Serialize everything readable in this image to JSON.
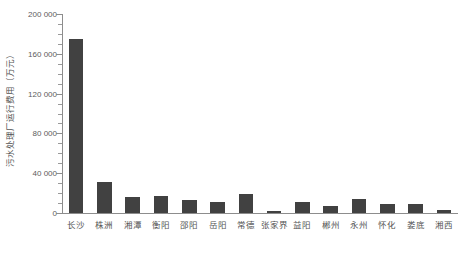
{
  "chart_data": {
    "type": "bar",
    "title": "",
    "subtitle": "",
    "xlabel": "",
    "ylabel": "污水处理厂运行费用（万元）",
    "categories": [
      "长沙",
      "株洲",
      "湘潭",
      "衡阳",
      "邵阳",
      "岳阳",
      "常德",
      "张家界",
      "益阳",
      "郴州",
      "永州",
      "怀化",
      "娄底",
      "湘西"
    ],
    "values": [
      175000,
      31000,
      16000,
      17000,
      13000,
      11000,
      19000,
      2000,
      11000,
      7000,
      14000,
      9000,
      9000,
      3000
    ],
    "ylim": [
      0,
      200000
    ],
    "ytick_values": [
      0,
      40000,
      80000,
      120000,
      160000,
      200000
    ],
    "ytick_labels": [
      "0",
      "40 000",
      "80 000",
      "120 000",
      "160 000",
      "200 000"
    ],
    "minor_tick_interval": 10000,
    "grid": false,
    "legend": false,
    "legend_position": "none",
    "bar_color": "#414141",
    "axis_color": "#8d8d8d",
    "background_color": "#ffffff"
  }
}
